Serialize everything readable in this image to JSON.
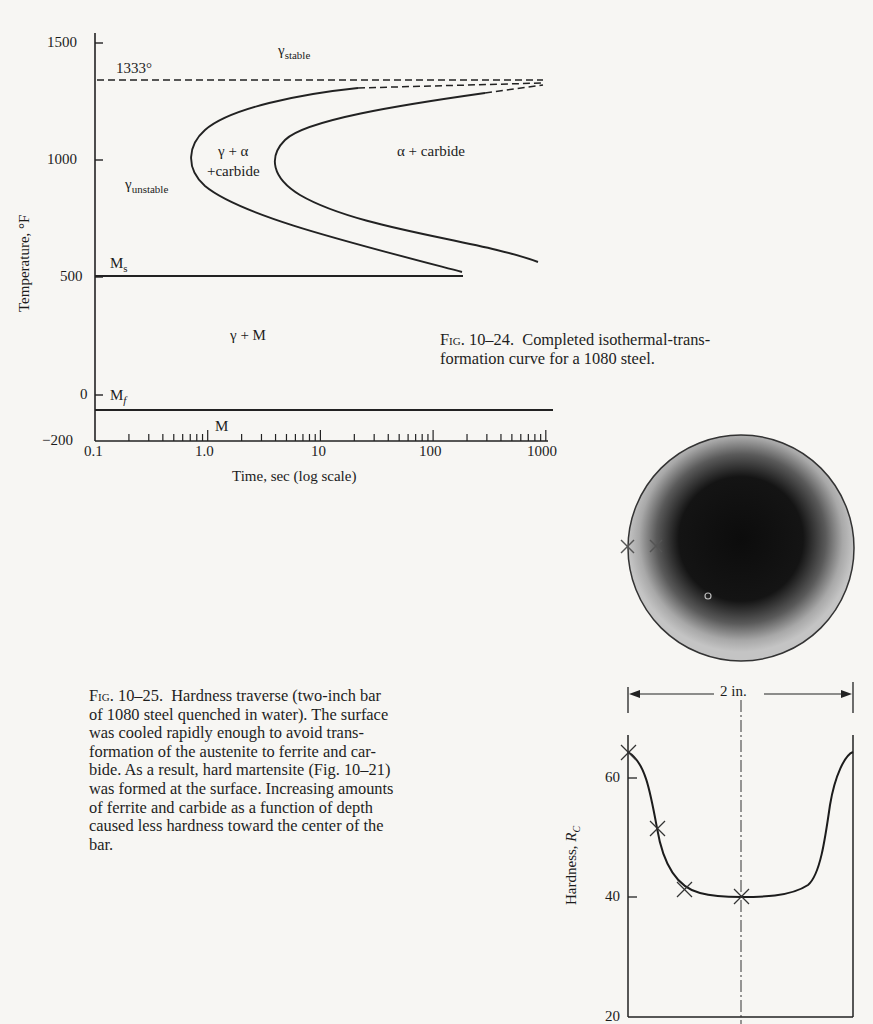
{
  "figures": {
    "ttt": {
      "caption_prefix": "Fig.",
      "caption_number": "10–24.",
      "caption_text": "Completed isothermal-transformation curve for a 1080 steel.",
      "caption_line1": "Completed isothermal-trans-",
      "caption_line2": "formation curve for a 1080 steel.",
      "xlabel": "Time, sec (log scale)",
      "ylabel": "Temperature, °F",
      "xticks": [
        "0.1",
        "1.0",
        "10",
        "100",
        "1000"
      ],
      "yticks": [
        "1500",
        "1000",
        "500",
        "0",
        "−200"
      ],
      "annotations": {
        "eutectoid": "1333°",
        "gamma_stable": "γ",
        "gamma_stable_sub": "stable",
        "gamma_unstable": "γ",
        "gamma_unstable_sub": "unstable",
        "gamma_alpha_1": "γ + α",
        "gamma_alpha_2": "+carbide",
        "alpha_carbide": "α + carbide",
        "ms": "M",
        "ms_sub": "s",
        "mf": "M",
        "mf_sub": "f",
        "gamma_m": "γ + M",
        "m": "M"
      }
    },
    "hardness": {
      "caption_prefix": "Fig.",
      "caption_number": "10–25.",
      "caption_lines": [
        "Hardness traverse (two-inch bar",
        "of 1080 steel quenched in water).  The surface",
        "was cooled rapidly enough to avoid trans-",
        "formation of the austenite to ferrite and car-",
        "bide.  As a result, hard martensite (Fig. 10–21)",
        "was formed at the surface.  Increasing amounts",
        "of ferrite and carbide as a function of depth",
        "caused less hardness toward the center of the",
        "bar."
      ],
      "ylabel": "Hardness, ",
      "ylabel_unit": "R",
      "ylabel_unit_sub": "C",
      "yticks": [
        "60",
        "40",
        "20"
      ],
      "dimension_label": "2 in."
    }
  },
  "chart_data": [
    {
      "type": "line",
      "title": "Completed isothermal-transformation curve for a 1080 steel",
      "xlabel": "Time, sec (log scale)",
      "ylabel": "Temperature, °F",
      "xscale": "log",
      "xlim": [
        0.1,
        1000
      ],
      "ylim": [
        -200,
        1500
      ],
      "xtick_labels": [
        "0.1",
        "1.0",
        "10",
        "100",
        "1000"
      ],
      "ytick_labels": [
        "1500",
        "1000",
        "500",
        "0",
        "-200"
      ],
      "grid": false,
      "series": [
        {
          "name": "Transformation start",
          "x": [
            1000,
            100,
            10,
            3,
            1.2,
            0.8,
            1.0,
            3,
            20,
            200
          ],
          "y": [
            1320,
            1280,
            1220,
            1150,
            1080,
            1000,
            900,
            760,
            620,
            510
          ]
        },
        {
          "name": "Transformation finish",
          "x": [
            1000,
            200,
            30,
            8,
            5,
            6,
            15,
            100,
            900
          ],
          "y": [
            1330,
            1290,
            1230,
            1130,
            1050,
            970,
            860,
            730,
            560
          ]
        },
        {
          "name": "Ms",
          "x": [
            0.1,
            200
          ],
          "y": [
            500,
            500
          ]
        },
        {
          "name": "Mf",
          "x": [
            0.1,
            1000
          ],
          "y": [
            -65,
            -65
          ]
        },
        {
          "name": "Eutectoid 1333°",
          "x": [
            0.1,
            1000
          ],
          "y": [
            1333,
            1333
          ],
          "style": "dashed"
        }
      ],
      "annotations": [
        "1333°",
        "γstable",
        "γunstable",
        "γ+α +carbide",
        "α + carbide",
        "Ms",
        "Mf",
        "γ + M",
        "M"
      ]
    },
    {
      "type": "line",
      "title": "Hardness traverse (two-inch bar of 1080 steel quenched in water)",
      "xlabel": "Position across 2 in. diameter",
      "ylabel": "Hardness, Rc",
      "xlim": [
        0,
        2
      ],
      "ylim": [
        20,
        66
      ],
      "ytick_labels": [
        "20",
        "40",
        "60"
      ],
      "grid": false,
      "series": [
        {
          "name": "Hardness",
          "x": [
            0,
            0.1,
            0.25,
            0.4,
            0.6,
            1.0,
            1.4,
            1.6,
            1.75,
            1.9,
            2.0
          ],
          "y": [
            65,
            62,
            51,
            43,
            40.5,
            40.5,
            40.5,
            43,
            51,
            62,
            65
          ]
        }
      ],
      "markers": [
        {
          "x": 0,
          "y": 65
        },
        {
          "x": 0.25,
          "y": 51
        },
        {
          "x": 0.5,
          "y": 42
        },
        {
          "x": 1.0,
          "y": 40.5
        }
      ]
    }
  ]
}
